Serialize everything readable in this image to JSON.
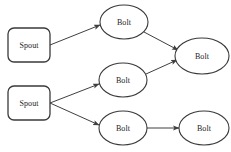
{
  "diagram": {
    "background_color": "#ffffff",
    "stroke_color": "#3a3a3a",
    "text_color": "#1b1b1b",
    "width": 231,
    "height": 152,
    "nodes": [
      {
        "id": "spout-1",
        "label": "Spout",
        "type": "spout",
        "shape": "rounded-rect",
        "x": 8,
        "y": 28,
        "w": 42,
        "h": 34,
        "rx": 6
      },
      {
        "id": "spout-2",
        "label": "Spout",
        "type": "spout",
        "shape": "rounded-rect",
        "x": 8,
        "y": 86,
        "w": 42,
        "h": 34,
        "rx": 6
      },
      {
        "id": "bolt-top",
        "label": "Bolt",
        "type": "bolt",
        "shape": "ellipse",
        "cx": 124,
        "cy": 22,
        "rx": 24,
        "ry": 17
      },
      {
        "id": "bolt-middle",
        "label": "Bolt",
        "type": "bolt",
        "shape": "ellipse",
        "cx": 123,
        "cy": 80,
        "rx": 24,
        "ry": 17
      },
      {
        "id": "bolt-bottom",
        "label": "Bolt",
        "type": "bolt",
        "shape": "ellipse",
        "cx": 123,
        "cy": 128,
        "rx": 24,
        "ry": 17
      },
      {
        "id": "bolt-right",
        "label": "Bolt",
        "type": "bolt",
        "shape": "ellipse",
        "cx": 202,
        "cy": 56,
        "rx": 27,
        "ry": 18
      },
      {
        "id": "bolt-bottom-right",
        "label": "Bolt",
        "type": "bolt",
        "shape": "ellipse",
        "cx": 204,
        "cy": 128,
        "rx": 25,
        "ry": 17
      }
    ],
    "edges": [
      {
        "id": "edge-spout1-bolttop",
        "from": "spout-1",
        "to": "bolt-top",
        "x1": 50,
        "y1": 45,
        "x2": 100,
        "y2": 25,
        "arrow": true
      },
      {
        "id": "edge-bolttop-boltright",
        "from": "bolt-top",
        "to": "bolt-right",
        "x1": 144,
        "y1": 32,
        "x2": 178,
        "y2": 50,
        "arrow": true
      },
      {
        "id": "edge-spout2-boltmiddle",
        "from": "spout-2",
        "to": "bolt-middle",
        "x1": 50,
        "y1": 103,
        "x2": 99,
        "y2": 84,
        "arrow": true
      },
      {
        "id": "edge-boltmiddle-boltright",
        "from": "bolt-middle",
        "to": "bolt-right",
        "x1": 146,
        "y1": 74,
        "x2": 177,
        "y2": 60,
        "arrow": true
      },
      {
        "id": "edge-spout2-boltbottom",
        "from": "spout-2",
        "to": "bolt-bottom",
        "x1": 50,
        "y1": 103,
        "x2": 99,
        "y2": 125,
        "arrow": true
      },
      {
        "id": "edge-boltbottom-boltbottomright",
        "from": "bolt-bottom",
        "to": "bolt-bottom-right",
        "x1": 147,
        "y1": 128,
        "x2": 179,
        "y2": 128,
        "arrow": true
      }
    ]
  }
}
